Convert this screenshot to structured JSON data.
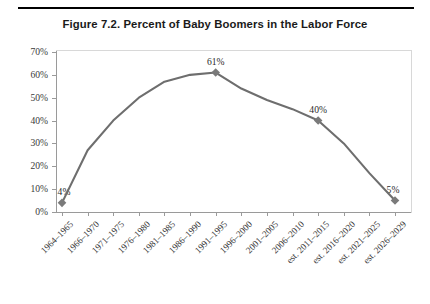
{
  "figure": {
    "title": "Figure 7.2.  Percent of Baby Boomers in the Labor Force"
  },
  "style": {
    "line_color": "#6e6e6e",
    "marker_color": "#7a7a7a",
    "axis_color": "#9a9a9a",
    "text_color": "#231f20",
    "background": "#ffffff"
  },
  "chart_data": {
    "type": "line",
    "title": "Figure 7.2.  Percent of Baby Boomers in the Labor Force",
    "xlabel": "",
    "ylabel": "",
    "ylim": [
      0,
      70
    ],
    "yticks": [
      0,
      10,
      20,
      30,
      40,
      50,
      60,
      70
    ],
    "ytick_labels": [
      "0%",
      "10%",
      "20%",
      "30%",
      "40%",
      "50%",
      "60%",
      "70%"
    ],
    "grid": false,
    "legend": "none",
    "categories": [
      "1964–1965",
      "1966–1970",
      "1971–1975",
      "1976–1980",
      "1981–1985",
      "1986–1990",
      "1991–1995",
      "1996–2000",
      "2001–2005",
      "2006–2010",
      "est. 2011–2015",
      "est. 2016–2020",
      "est. 2021–2025",
      "est. 2026–2029"
    ],
    "values": [
      4,
      27,
      40,
      50,
      57,
      60,
      61,
      54,
      49,
      45,
      40,
      30,
      17,
      5
    ],
    "point_labels": [
      {
        "index": 0,
        "text": "4%"
      },
      {
        "index": 6,
        "text": "61%"
      },
      {
        "index": 10,
        "text": "40%"
      },
      {
        "index": 13,
        "text": "5%"
      }
    ],
    "markers_at": [
      0,
      6,
      10,
      13
    ]
  }
}
